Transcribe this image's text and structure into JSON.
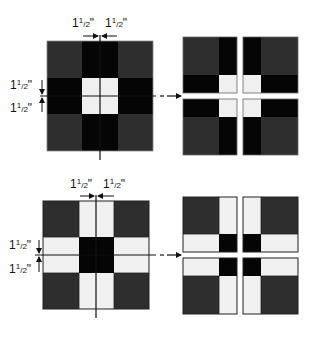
{
  "colors": {
    "dark_gray": "#2e2e2e",
    "black": "#050505",
    "light": "#f0f0f0",
    "line": "#111111",
    "background": "#ffffff"
  },
  "top_example": {
    "name": "Block with light center",
    "patches": {
      "corners": "dark_gray",
      "edges": "black",
      "center": "light"
    },
    "labels": {
      "top_left": {
        "whole": "1",
        "num": "1",
        "den": "2",
        "unit": "\""
      },
      "top_right": {
        "whole": "1",
        "num": "1",
        "den": "2",
        "unit": "\""
      },
      "left_upper": {
        "whole": "1",
        "num": "1",
        "den": "2",
        "unit": "\""
      },
      "left_lower": {
        "whole": "1",
        "num": "1",
        "den": "2",
        "unit": "\""
      }
    },
    "result": "four quarter units"
  },
  "bottom_example": {
    "name": "Block with dark center",
    "patches": {
      "corners": "dark_gray",
      "edges": "light",
      "center": "black"
    },
    "labels": {
      "top_left": {
        "whole": "1",
        "num": "1",
        "den": "2",
        "unit": "\""
      },
      "top_right": {
        "whole": "1",
        "num": "1",
        "den": "2",
        "unit": "\""
      },
      "left_upper": {
        "whole": "1",
        "num": "1",
        "den": "2",
        "unit": "\""
      },
      "left_lower": {
        "whole": "1",
        "num": "1",
        "den": "2",
        "unit": "\""
      }
    },
    "result": "four quarter units"
  }
}
